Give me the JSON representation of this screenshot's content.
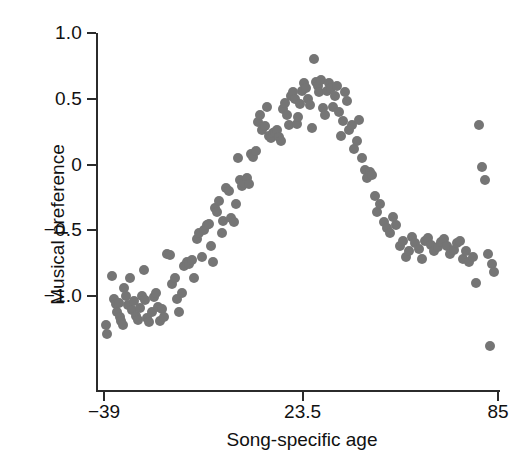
{
  "chart_data": {
    "type": "scatter",
    "title": "",
    "xlabel": "Song-specific age",
    "ylabel": "Musical preference",
    "xlim": [
      -39,
      85
    ],
    "ylim": [
      -1.45,
      1.0
    ],
    "xticks": [
      -39,
      23.5,
      85
    ],
    "xticklabels": [
      "−39",
      "23.5",
      "85"
    ],
    "yticks": [
      1.0,
      0.5,
      0,
      -0.5,
      -1.0
    ],
    "yticklabels": [
      "1.0",
      "0.5",
      "0",
      "−0.5",
      "−1.0"
    ],
    "grid": false,
    "legend": null,
    "marker_color": "#757575",
    "marker_size_px": 10,
    "axis_color": "#2b2b2b",
    "spines": [
      "left",
      "bottom"
    ],
    "n_points": 145,
    "points": [
      [
        -38.4,
        -1.22
      ],
      [
        -38.1,
        -1.29
      ],
      [
        -36.6,
        -0.85
      ],
      [
        -36.0,
        -1.02
      ],
      [
        -35.2,
        -1.06
      ],
      [
        -35.0,
        -1.12
      ],
      [
        -34.4,
        -1.05
      ],
      [
        -34.1,
        -1.16
      ],
      [
        -33.6,
        -1.19
      ],
      [
        -33.0,
        -1.22
      ],
      [
        -32.6,
        -0.94
      ],
      [
        -32.2,
        -1.0
      ],
      [
        -31.5,
        -1.07
      ],
      [
        -30.8,
        -0.86
      ],
      [
        -30.2,
        -1.11
      ],
      [
        -29.6,
        -1.04
      ],
      [
        -29.0,
        -1.15
      ],
      [
        -28.4,
        -1.18
      ],
      [
        -27.6,
        -1.09
      ],
      [
        -27.0,
        -1.0
      ],
      [
        -26.4,
        -0.8
      ],
      [
        -26.0,
        -1.03
      ],
      [
        -25.4,
        -1.17
      ],
      [
        -24.8,
        -1.2
      ],
      [
        -24.0,
        -1.12
      ],
      [
        -23.3,
        -1.01
      ],
      [
        -22.6,
        -0.98
      ],
      [
        -22.0,
        -1.08
      ],
      [
        -21.4,
        -1.19
      ],
      [
        -20.7,
        -1.1
      ],
      [
        -20.0,
        -1.16
      ],
      [
        -19.2,
        -0.68
      ],
      [
        -18.3,
        -0.69
      ],
      [
        -17.5,
        -0.91
      ],
      [
        -16.8,
        -0.86
      ],
      [
        -16.0,
        -1.02
      ],
      [
        -15.4,
        -1.12
      ],
      [
        -14.6,
        -0.98
      ],
      [
        -13.8,
        -0.77
      ],
      [
        -13.0,
        -0.74
      ],
      [
        -12.2,
        -0.76
      ],
      [
        -11.4,
        -0.73
      ],
      [
        -10.6,
        -0.86
      ],
      [
        -9.8,
        -0.57
      ],
      [
        -9.0,
        -0.52
      ],
      [
        -8.2,
        -0.7
      ],
      [
        -7.4,
        -0.5
      ],
      [
        -6.6,
        -0.46
      ],
      [
        -6.0,
        -0.45
      ],
      [
        -5.2,
        -0.62
      ],
      [
        -4.6,
        -0.74
      ],
      [
        -4.0,
        -0.33
      ],
      [
        -3.4,
        -0.36
      ],
      [
        -2.8,
        -0.28
      ],
      [
        -2.0,
        -0.52
      ],
      [
        -1.4,
        -0.43
      ],
      [
        -0.6,
        -0.18
      ],
      [
        0.2,
        -0.2
      ],
      [
        1.0,
        -0.41
      ],
      [
        1.8,
        -0.44
      ],
      [
        2.6,
        -0.3
      ],
      [
        3.2,
        0.05
      ],
      [
        3.8,
        -0.12
      ],
      [
        4.4,
        -0.16
      ],
      [
        5.2,
        -0.14
      ],
      [
        6.0,
        -0.1
      ],
      [
        6.6,
        -0.15
      ],
      [
        7.2,
        0.08
      ],
      [
        8.0,
        0.06
      ],
      [
        8.8,
        0.1
      ],
      [
        9.6,
        0.32
      ],
      [
        10.2,
        0.38
      ],
      [
        10.8,
        0.26
      ],
      [
        11.6,
        0.29
      ],
      [
        12.4,
        0.44
      ],
      [
        13.0,
        0.22
      ],
      [
        13.6,
        0.2
      ],
      [
        14.2,
        0.24
      ],
      [
        14.8,
        0.25
      ],
      [
        15.4,
        0.26
      ],
      [
        16.0,
        0.21
      ],
      [
        16.8,
        0.18
      ],
      [
        17.4,
        0.42
      ],
      [
        18.0,
        0.47
      ],
      [
        18.6,
        0.38
      ],
      [
        19.2,
        0.3
      ],
      [
        19.8,
        0.52
      ],
      [
        20.4,
        0.55
      ],
      [
        21.0,
        0.5
      ],
      [
        21.6,
        0.31
      ],
      [
        22.2,
        0.36
      ],
      [
        22.8,
        0.46
      ],
      [
        23.4,
        0.56
      ],
      [
        24.0,
        0.62
      ],
      [
        24.6,
        0.58
      ],
      [
        25.2,
        0.5
      ],
      [
        25.8,
        0.45
      ],
      [
        26.4,
        0.28
      ],
      [
        27.0,
        0.8
      ],
      [
        27.6,
        0.63
      ],
      [
        28.2,
        0.6
      ],
      [
        28.8,
        0.55
      ],
      [
        29.4,
        0.64
      ],
      [
        30.0,
        0.43
      ],
      [
        30.6,
        0.38
      ],
      [
        31.2,
        0.56
      ],
      [
        31.8,
        0.62
      ],
      [
        32.4,
        0.58
      ],
      [
        33.0,
        0.44
      ],
      [
        33.6,
        0.52
      ],
      [
        34.4,
        0.6
      ],
      [
        35.0,
        0.4
      ],
      [
        35.6,
        0.22
      ],
      [
        36.2,
        0.33
      ],
      [
        36.8,
        0.55
      ],
      [
        37.4,
        0.48
      ],
      [
        38.2,
        0.26
      ],
      [
        39.0,
        0.3
      ],
      [
        39.8,
        0.12
      ],
      [
        40.6,
        0.18
      ],
      [
        41.4,
        0.34
      ],
      [
        42.2,
        0.05
      ],
      [
        43.0,
        -0.04
      ],
      [
        43.8,
        -0.1
      ],
      [
        44.6,
        -0.06
      ],
      [
        45.4,
        -0.08
      ],
      [
        46.2,
        -0.24
      ],
      [
        47.0,
        -0.36
      ],
      [
        48.0,
        -0.3
      ],
      [
        49.0,
        -0.44
      ],
      [
        50.0,
        -0.48
      ],
      [
        51.0,
        -0.52
      ],
      [
        52.0,
        -0.4
      ],
      [
        53.0,
        -0.46
      ],
      [
        54.0,
        -0.62
      ],
      [
        55.0,
        -0.58
      ],
      [
        56.0,
        -0.7
      ],
      [
        57.0,
        -0.66
      ],
      [
        58.0,
        -0.55
      ],
      [
        59.0,
        -0.6
      ],
      [
        60.0,
        -0.64
      ],
      [
        61.0,
        -0.72
      ],
      [
        62.0,
        -0.58
      ],
      [
        63.0,
        -0.56
      ],
      [
        64.0,
        -0.61
      ],
      [
        65.0,
        -0.66
      ],
      [
        66.0,
        -0.63
      ],
      [
        67.0,
        -0.59
      ],
      [
        68.0,
        -0.57
      ],
      [
        69.0,
        -0.62
      ],
      [
        70.0,
        -0.68
      ],
      [
        71.0,
        -0.65
      ],
      [
        72.0,
        -0.6
      ],
      [
        73.0,
        -0.58
      ],
      [
        74.0,
        -0.72
      ],
      [
        75.0,
        -0.66
      ],
      [
        76.0,
        -0.74
      ],
      [
        77.0,
        -0.7
      ],
      [
        78.0,
        -0.9
      ],
      [
        79.0,
        0.3
      ],
      [
        80.0,
        -0.02
      ],
      [
        81.0,
        -0.12
      ],
      [
        82.0,
        -0.68
      ],
      [
        83.0,
        -0.76
      ],
      [
        83.6,
        -0.82
      ],
      [
        82.5,
        -1.38
      ]
    ]
  },
  "axis": {
    "y_tick_labels": [
      "1.0",
      "0.5",
      "0",
      "−0.5",
      "−1.0"
    ],
    "x_tick_labels": [
      "−39",
      "23.5",
      "85"
    ],
    "x_title": "Song-specific age",
    "y_title": "Musical preference"
  }
}
